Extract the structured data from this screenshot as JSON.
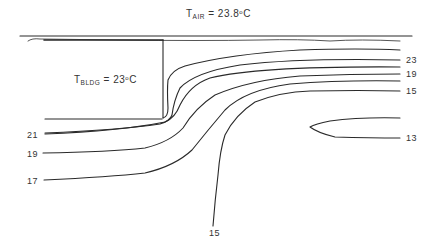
{
  "diagram": {
    "title": {
      "symbol": "T",
      "subscript": "AIR",
      "value": "= 23.8",
      "unit_sup": "o",
      "unit": "C"
    },
    "building_label": {
      "symbol": "T",
      "subscript": "BLDG",
      "value": "= 23",
      "unit_sup": "o",
      "unit": "C"
    },
    "isotherm_labels_right": [
      "23",
      "19",
      "15",
      "13"
    ],
    "isotherm_labels_left": [
      "21",
      "19",
      "17"
    ],
    "isotherm_label_bottom": "15",
    "line_color": "#2a2a2a",
    "background": "#ffffff"
  }
}
